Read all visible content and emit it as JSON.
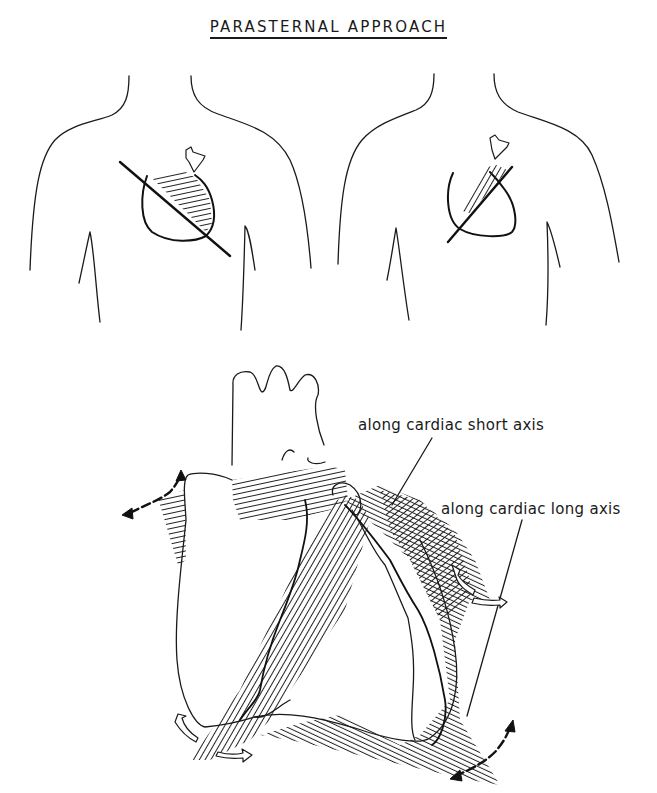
{
  "title": "PARASTERNAL APPROACH",
  "figures": {
    "left_torso": {
      "description": "torso outline with probe and imaging plane along cardiac long axis"
    },
    "right_torso": {
      "description": "torso outline with probe and imaging plane along cardiac short axis"
    },
    "heart": {
      "description": "heart diagram with two hatched imaging planes and rotation arrows"
    }
  },
  "labels": {
    "short_axis": "along cardiac short axis",
    "long_axis": "along cardiac long axis"
  },
  "colors": {
    "ink": "#1a1a1a",
    "background": "#ffffff"
  }
}
